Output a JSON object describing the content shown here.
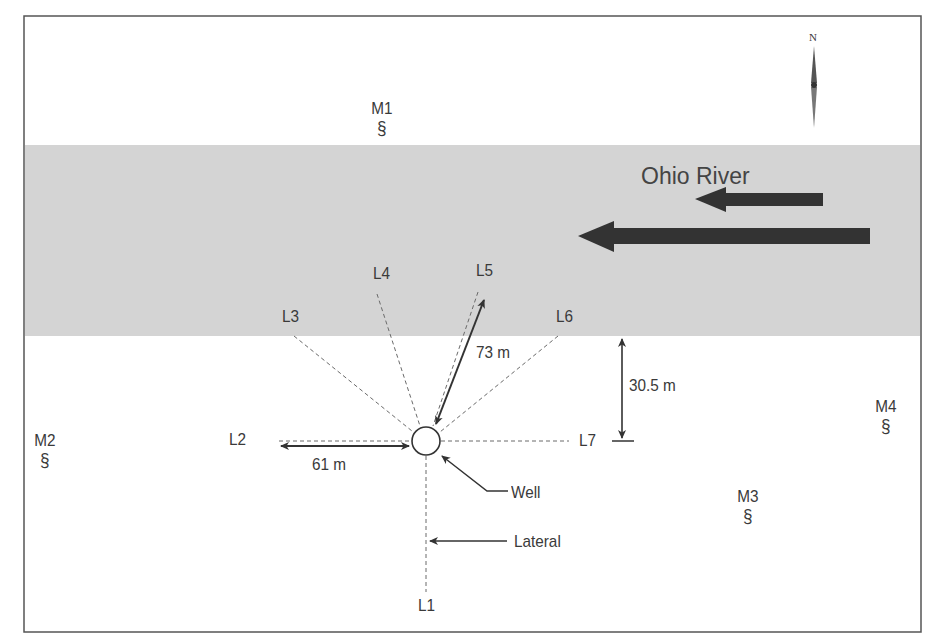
{
  "figure": {
    "river": {
      "label": "Ohio River",
      "flow_direction": "west",
      "fill_color": "#d4d4d4"
    },
    "north_arrow": {
      "label": "N"
    },
    "well": {
      "label": "Well"
    },
    "lateral_pointer": {
      "label": "Lateral"
    },
    "laterals": [
      {
        "id": "L1",
        "label": "L1"
      },
      {
        "id": "L2",
        "label": "L2"
      },
      {
        "id": "L3",
        "label": "L3"
      },
      {
        "id": "L4",
        "label": "L4"
      },
      {
        "id": "L5",
        "label": "L5"
      },
      {
        "id": "L6",
        "label": "L6"
      },
      {
        "id": "L7",
        "label": "L7"
      }
    ],
    "monitoring_wells": [
      {
        "id": "M1",
        "label": "M1",
        "symbol": "§"
      },
      {
        "id": "M2",
        "label": "M2",
        "symbol": "§"
      },
      {
        "id": "M3",
        "label": "M3",
        "symbol": "§"
      },
      {
        "id": "M4",
        "label": "M4",
        "symbol": "§"
      }
    ],
    "dimensions": {
      "l2_length": "61 m",
      "l5_length": "73 m",
      "distance_to_river": "30.5 m"
    },
    "colors": {
      "line": "#3a3a3a",
      "arrow": "#333333",
      "dashed": "#6a6a6a",
      "frame": "#555555"
    }
  }
}
